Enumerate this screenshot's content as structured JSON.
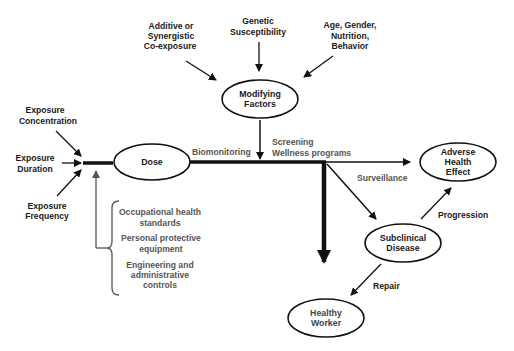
{
  "diagram": {
    "type": "exposure-to-health-outcome flow diagram",
    "nodes": {
      "dose": {
        "label": [
          "Dose"
        ]
      },
      "modifying": {
        "label": [
          "Modifying",
          "Factors"
        ]
      },
      "adverse": {
        "label": [
          "Adverse",
          "Health",
          "Effect"
        ]
      },
      "subclinical": {
        "label": [
          "Subclinical",
          "Disease"
        ]
      },
      "healthy": {
        "label": [
          "Healthy",
          "Worker"
        ]
      }
    },
    "inputs": {
      "concentration": {
        "label": [
          "Exposure",
          "Concentration"
        ]
      },
      "duration": {
        "label": [
          "Exposure",
          "Duration"
        ]
      },
      "frequency": {
        "label": [
          "Exposure",
          "Frequency"
        ]
      },
      "additive": {
        "label": [
          "Additive or",
          "Synergistic",
          "Co-exposure"
        ]
      },
      "genetic": {
        "label": [
          "Genetic",
          "Susceptibility"
        ]
      },
      "age": {
        "label": [
          "Age, Gender,",
          "Nutrition,",
          "Behavior"
        ]
      }
    },
    "edge_labels": {
      "biomonitoring": "Biomonitoring",
      "screening": "Screening",
      "wellness": "Wellness programs",
      "surveillance": "Surveillance",
      "progression": "Progression",
      "repair": "Repair"
    },
    "controls": {
      "items": [
        [
          "Occupational health",
          "standards"
        ],
        [
          "Personal protective",
          "equipment"
        ],
        [
          "Engineering and",
          "administrative",
          "controls"
        ]
      ]
    }
  }
}
